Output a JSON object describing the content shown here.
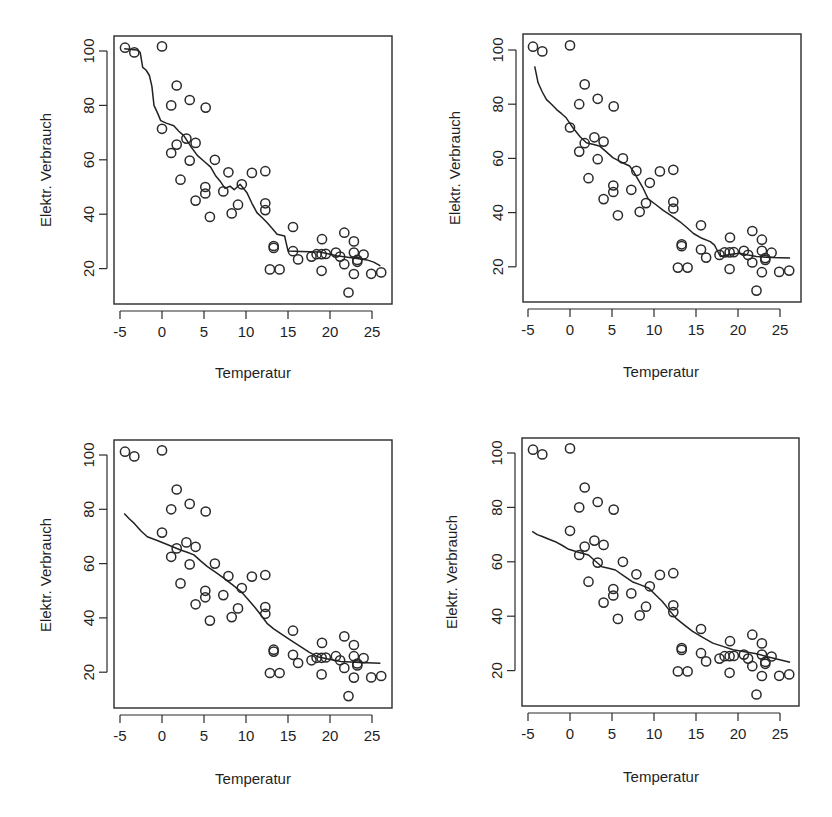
{
  "figure": {
    "layout": "2x2 grid of scatter plots with smoothing curves",
    "panels_label": [
      "top-left",
      "top-right",
      "bottom-left",
      "bottom-right"
    ]
  },
  "chart_data": [
    {
      "type": "scatter",
      "panel": "top-left",
      "title": "",
      "xlabel": "Temperatur",
      "ylabel": "Elektr. Verbrauch",
      "xticks": [
        "-5",
        "0",
        "5",
        "10",
        "15",
        "20",
        "25"
      ],
      "yticks": [
        "20",
        "40",
        "60",
        "80",
        "100"
      ],
      "xlim": [
        -5.2,
        27
      ],
      "ylim": [
        8,
        105
      ],
      "grid": false,
      "points_ref": "shared_points",
      "smooth_line": [
        [
          -4.5,
          100.8
        ],
        [
          -3.0,
          100.4
        ],
        [
          -2.6,
          99.5
        ],
        [
          -2.3,
          94
        ],
        [
          -1.9,
          93
        ],
        [
          -1.5,
          91
        ],
        [
          -1.2,
          87
        ],
        [
          -0.95,
          80
        ],
        [
          -0.5,
          77
        ],
        [
          -0.15,
          74.4
        ],
        [
          0.5,
          73.5
        ],
        [
          1.4,
          72.5
        ],
        [
          2.0,
          70.5
        ],
        [
          2.6,
          68.9
        ],
        [
          3.4,
          65
        ],
        [
          4.2,
          61.6
        ],
        [
          5.0,
          59.5
        ],
        [
          5.8,
          57.3
        ],
        [
          6.4,
          54
        ],
        [
          7.0,
          51.8
        ],
        [
          7.5,
          49.5
        ],
        [
          8.1,
          50.3
        ],
        [
          8.6,
          49
        ],
        [
          9.3,
          51
        ],
        [
          10.1,
          48
        ],
        [
          10.7,
          44
        ],
        [
          11.3,
          40.6
        ],
        [
          12.0,
          38.5
        ],
        [
          12.5,
          36.9
        ],
        [
          13.2,
          34.5
        ],
        [
          13.7,
          32.6
        ],
        [
          14.6,
          32
        ],
        [
          15.0,
          26.5
        ],
        [
          16.5,
          26.3
        ],
        [
          18.8,
          26.1
        ],
        [
          20.8,
          24.7
        ],
        [
          23.2,
          23.7
        ],
        [
          24.4,
          23.2
        ],
        [
          25.2,
          22.4
        ],
        [
          26.0,
          21
        ]
      ]
    },
    {
      "type": "scatter",
      "panel": "top-right",
      "title": "",
      "xlabel": "Temperatur",
      "ylabel": "Elektr. Verbrauch",
      "xticks": [
        "-5",
        "0",
        "5",
        "10",
        "15",
        "20",
        "25"
      ],
      "yticks": [
        "20",
        "40",
        "60",
        "80",
        "100"
      ],
      "xlim": [
        -5.2,
        27
      ],
      "ylim": [
        8,
        105
      ],
      "grid": false,
      "points_ref": "shared_points",
      "smooth_line": [
        [
          -4.2,
          94
        ],
        [
          -3.8,
          87.9
        ],
        [
          -3.3,
          84.5
        ],
        [
          -2.8,
          81.7
        ],
        [
          -2.2,
          80
        ],
        [
          -1.6,
          78
        ],
        [
          -1.0,
          76.5
        ],
        [
          -0.45,
          75
        ],
        [
          0.35,
          71.3
        ],
        [
          1.2,
          68
        ],
        [
          1.95,
          65.8
        ],
        [
          2.7,
          65.2
        ],
        [
          3.5,
          64.6
        ],
        [
          4.3,
          62.5
        ],
        [
          5.1,
          60.3
        ],
        [
          6.0,
          58.8
        ],
        [
          7.1,
          57.2
        ],
        [
          7.6,
          55
        ],
        [
          8.1,
          52.3
        ],
        [
          8.7,
          49
        ],
        [
          9.3,
          45.1
        ],
        [
          10.2,
          43
        ],
        [
          11.1,
          40.8
        ],
        [
          12.1,
          38.8
        ],
        [
          13.1,
          36.6
        ],
        [
          13.9,
          34.5
        ],
        [
          14.7,
          32.3
        ],
        [
          15.7,
          30.5
        ],
        [
          16.7,
          29.3
        ],
        [
          17.2,
          28
        ],
        [
          17.5,
          26.2
        ],
        [
          17.9,
          23.8
        ],
        [
          19.0,
          24.5
        ],
        [
          20.2,
          25
        ],
        [
          21.2,
          24.3
        ],
        [
          22.2,
          23.8
        ],
        [
          24.0,
          23.4
        ],
        [
          26.2,
          23.2
        ]
      ]
    },
    {
      "type": "scatter",
      "panel": "bottom-left",
      "title": "",
      "xlabel": "Temperatur",
      "ylabel": "Elektr. Verbrauch",
      "xticks": [
        "-5",
        "0",
        "5",
        "10",
        "15",
        "20",
        "25"
      ],
      "yticks": [
        "20",
        "40",
        "60",
        "80",
        "100"
      ],
      "xlim": [
        -5.2,
        27
      ],
      "ylim": [
        8,
        105
      ],
      "grid": false,
      "points_ref": "shared_points",
      "smooth_line": [
        [
          -4.5,
          78.5
        ],
        [
          -3.9,
          76.5
        ],
        [
          -3.3,
          74.8
        ],
        [
          -2.5,
          72
        ],
        [
          -1.75,
          69.9
        ],
        [
          -0.8,
          68.8
        ],
        [
          0.25,
          67.5
        ],
        [
          1.2,
          66.3
        ],
        [
          2.2,
          65
        ],
        [
          3.0,
          64.2
        ],
        [
          3.8,
          63.2
        ],
        [
          4.6,
          61
        ],
        [
          5.4,
          58.9
        ],
        [
          6.4,
          56.8
        ],
        [
          7.4,
          54.6
        ],
        [
          8.4,
          52.2
        ],
        [
          9.4,
          49.7
        ],
        [
          10.2,
          47
        ],
        [
          11.0,
          44.1
        ],
        [
          11.8,
          41
        ],
        [
          12.5,
          38
        ],
        [
          13.3,
          36
        ],
        [
          14.1,
          34.3
        ],
        [
          15.3,
          31.8
        ],
        [
          16.5,
          29.4
        ],
        [
          17.5,
          27.4
        ],
        [
          18.5,
          25.7
        ],
        [
          19.9,
          24.8
        ],
        [
          21.3,
          23.9
        ],
        [
          23.6,
          23.6
        ],
        [
          26.0,
          23.3
        ]
      ]
    },
    {
      "type": "scatter",
      "panel": "bottom-right",
      "title": "",
      "xlabel": "Temperatur",
      "ylabel": "Elektr. Verbrauch",
      "xticks": [
        "-5",
        "0",
        "5",
        "10",
        "15",
        "20",
        "25"
      ],
      "yticks": [
        "20",
        "40",
        "60",
        "80",
        "100"
      ],
      "xlim": [
        -5.2,
        27
      ],
      "ylim": [
        8,
        105
      ],
      "grid": false,
      "points_ref": "shared_points",
      "smooth_line": [
        [
          -4.5,
          71.2
        ],
        [
          -3.9,
          70
        ],
        [
          -3.3,
          69.3
        ],
        [
          -2.5,
          68.3
        ],
        [
          -1.75,
          67.4
        ],
        [
          -0.9,
          66
        ],
        [
          -0.15,
          64.6
        ],
        [
          1.0,
          63.5
        ],
        [
          2.2,
          62.5
        ],
        [
          3.0,
          60.3
        ],
        [
          3.8,
          58.2
        ],
        [
          4.6,
          57.6
        ],
        [
          5.4,
          57
        ],
        [
          6.4,
          54.8
        ],
        [
          7.4,
          52.7
        ],
        [
          8.4,
          51.5
        ],
        [
          9.4,
          50.3
        ],
        [
          10.2,
          47.8
        ],
        [
          11.0,
          45.4
        ],
        [
          11.8,
          42.3
        ],
        [
          12.6,
          39.3
        ],
        [
          13.6,
          36.8
        ],
        [
          14.6,
          34.4
        ],
        [
          15.8,
          32.2
        ],
        [
          17.0,
          30.1
        ],
        [
          18.2,
          28.9
        ],
        [
          19.4,
          27.7
        ],
        [
          20.8,
          26.9
        ],
        [
          22.2,
          26.2
        ],
        [
          23.4,
          25.2
        ],
        [
          24.6,
          24.3
        ],
        [
          26.2,
          23.1
        ]
      ]
    }
  ],
  "shared_points": [
    [
      -4.4,
      101.2
    ],
    [
      -3.3,
      99.5
    ],
    [
      0.0,
      101.7
    ],
    [
      1.75,
      87.3
    ],
    [
      1.1,
      80.0
    ],
    [
      3.3,
      82.0
    ],
    [
      5.2,
      79.2
    ],
    [
      0.0,
      71.4
    ],
    [
      2.9,
      67.8
    ],
    [
      4.0,
      66.2
    ],
    [
      1.75,
      65.6
    ],
    [
      1.1,
      62.5
    ],
    [
      3.3,
      59.7
    ],
    [
      6.3,
      60.0
    ],
    [
      2.2,
      52.7
    ],
    [
      7.9,
      55.4
    ],
    [
      10.7,
      55.2
    ],
    [
      12.3,
      55.8
    ],
    [
      5.15,
      50.0
    ],
    [
      5.15,
      47.6
    ],
    [
      9.5,
      51.0
    ],
    [
      7.3,
      48.4
    ],
    [
      4.0,
      45.0
    ],
    [
      9.05,
      43.5
    ],
    [
      8.3,
      40.3
    ],
    [
      12.3,
      44.0
    ],
    [
      12.3,
      41.5
    ],
    [
      5.7,
      39.0
    ],
    [
      13.3,
      28.3
    ],
    [
      13.3,
      27.6
    ],
    [
      12.85,
      19.7
    ],
    [
      14.0,
      19.7
    ],
    [
      15.6,
      35.3
    ],
    [
      15.6,
      26.4
    ],
    [
      16.2,
      23.4
    ],
    [
      17.8,
      24.4
    ],
    [
      18.4,
      25.3
    ],
    [
      19.0,
      25.3
    ],
    [
      19.5,
      25.4
    ],
    [
      19.05,
      30.8
    ],
    [
      19.0,
      19.2
    ],
    [
      20.7,
      25.9
    ],
    [
      21.2,
      24.4
    ],
    [
      21.7,
      33.2
    ],
    [
      21.7,
      21.6
    ],
    [
      22.85,
      30.0
    ],
    [
      22.85,
      25.9
    ],
    [
      22.85,
      18.0
    ],
    [
      23.25,
      23.2
    ],
    [
      23.25,
      22.5
    ],
    [
      24.0,
      25.2
    ],
    [
      22.2,
      11.2
    ],
    [
      24.9,
      18.1
    ],
    [
      26.1,
      18.6
    ]
  ],
  "panels": [
    {
      "x_axis_label": "Temperatur",
      "y_axis_label": "Elektr. Verbrauch"
    },
    {
      "x_axis_label": "Temperatur",
      "y_axis_label": "Elektr. Verbrauch"
    },
    {
      "x_axis_label": "Temperatur",
      "y_axis_label": "Elektr. Verbrauch"
    },
    {
      "x_axis_label": "Temperatur",
      "y_axis_label": "Elektr. Verbrauch"
    }
  ],
  "colors": {
    "ink": "#222222",
    "background": "#ffffff"
  }
}
